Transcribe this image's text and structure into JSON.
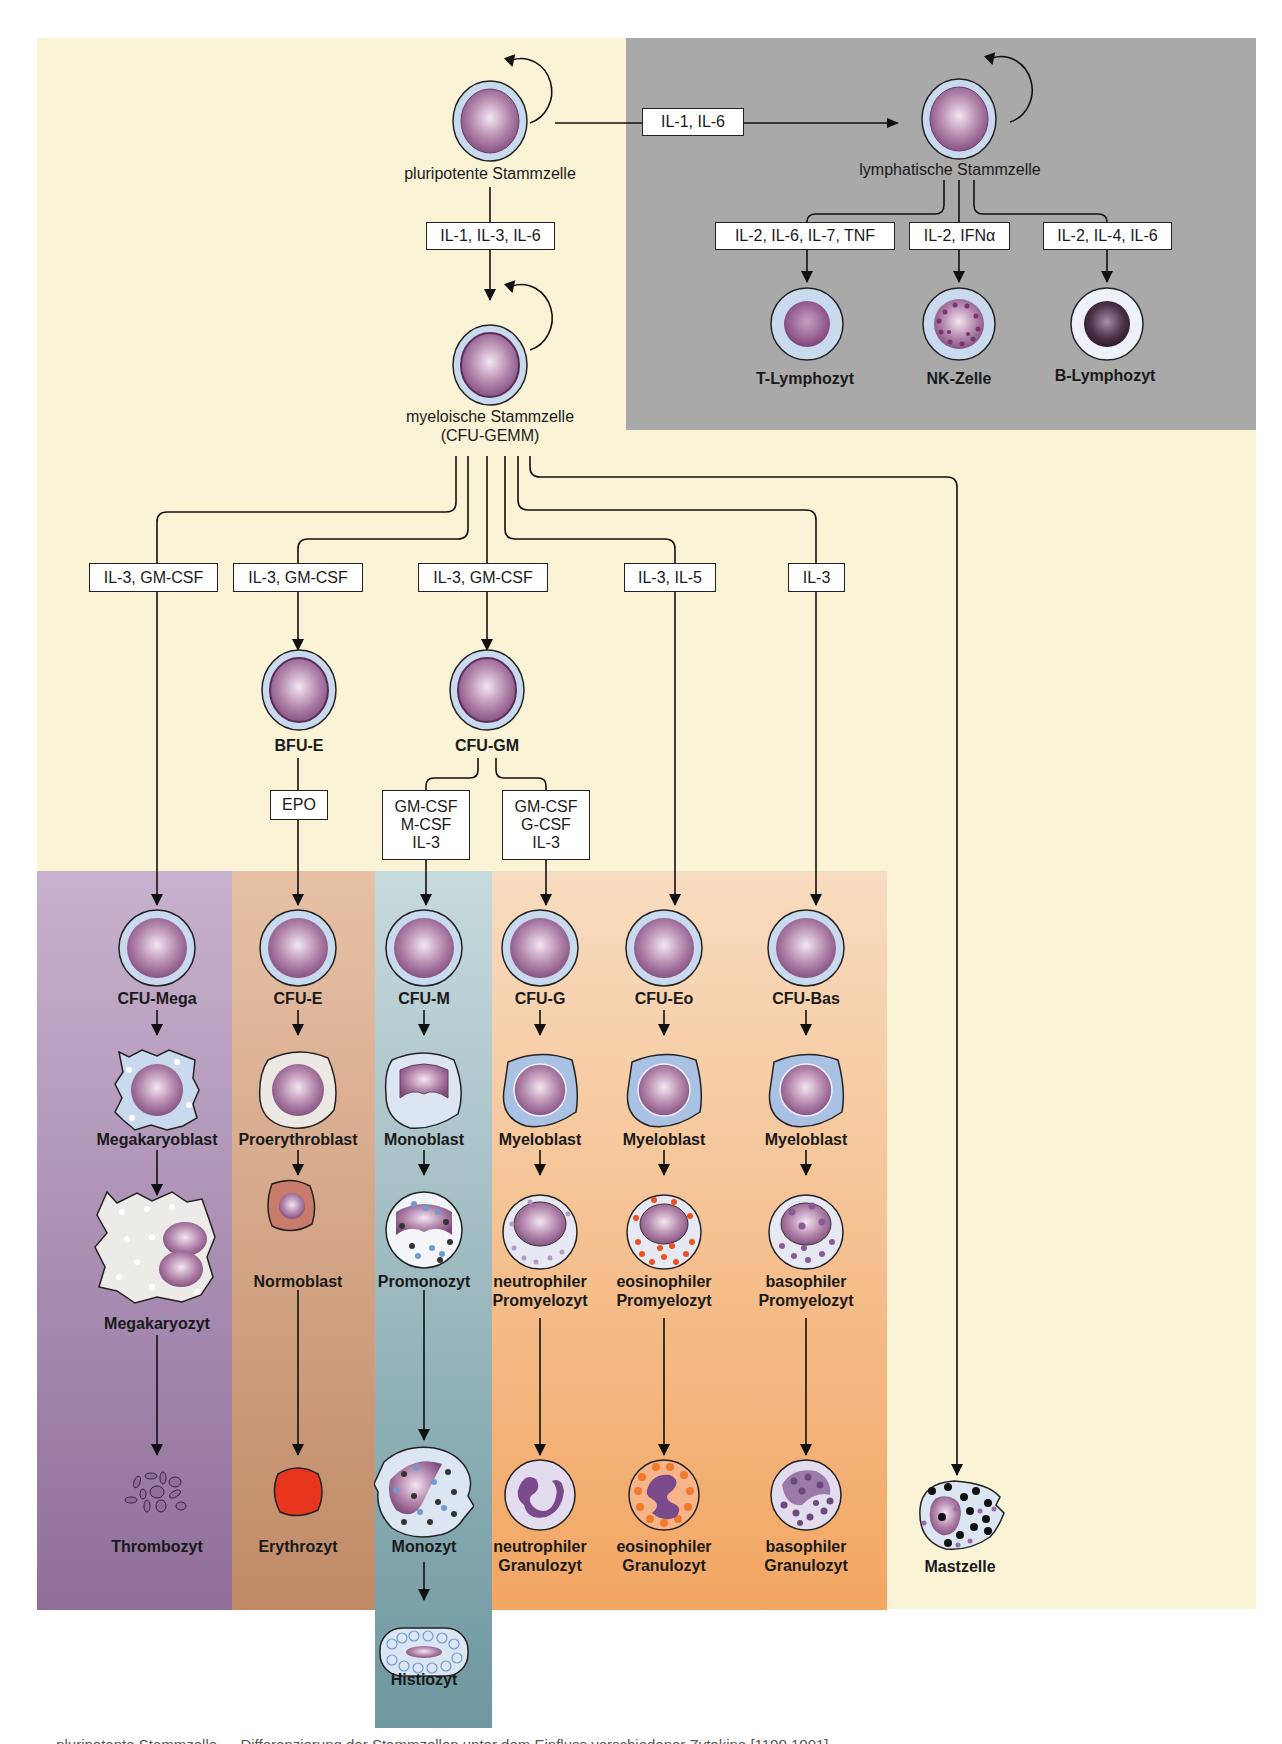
{
  "figure": {
    "caption_partial": "… pluripotente Stammzelle … Differenzierung der Stammzellen unter dem Einfluss verschiedener Zytokine [1100 1001]",
    "colors": {
      "background_cream": "#fbf3d6",
      "lymphatic_panel": "#a9a9a9",
      "megakaryocyte_lineage": "#a98bb2",
      "erythrocyte_lineage": "#d6a584",
      "monocyte_lineage": "#93b3b9",
      "granulocyte_lineage": "#f4bb86",
      "erythrocyte_red": "#e8361e",
      "eosinophil_granule": "#f06a2a"
    }
  },
  "stem_cells": {
    "pluripotent": "pluripotente Stammzelle",
    "lymphatic": "lymphatische Stammzelle",
    "myeloid_line1": "myeloische Stammzelle",
    "myeloid_line2": "(CFU-GEMM)"
  },
  "cytokines": {
    "to_lymphatic": "IL-1, IL-6",
    "to_myeloid": "IL-1, IL-3, IL-6",
    "t_lymph": "IL-2, IL-6, IL-7, TNF",
    "nk": "IL-2, IFNα",
    "b_lymph": "IL-2, IL-4, IL-6",
    "mega": "IL-3, GM-CSF",
    "bfu_e": "IL-3, GM-CSF",
    "cfu_gm": "IL-3, GM-CSF",
    "eo": "IL-3, IL-5",
    "bas": "IL-3",
    "epo": "EPO",
    "mono": [
      "GM-CSF",
      "M-CSF",
      "IL-3"
    ],
    "gran": [
      "GM-CSF",
      "G-CSF",
      "IL-3"
    ]
  },
  "lymphoid_cells": {
    "t": "T-Lymphozyt",
    "nk": "NK-Zelle",
    "b": "B-Lymphozyt"
  },
  "progenitors": {
    "bfu_e": "BFU-E",
    "cfu_gm": "CFU-GM"
  },
  "lineages": [
    {
      "cfu": "CFU-Mega",
      "blast": "Megakaryoblast",
      "inter": [
        "Megakaryozyt"
      ],
      "final": [
        "Thrombozyt"
      ]
    },
    {
      "cfu": "CFU-E",
      "blast": "Proerythroblast",
      "inter": [
        "Normoblast"
      ],
      "final": [
        "Erythrozyt"
      ]
    },
    {
      "cfu": "CFU-M",
      "blast": "Monoblast",
      "inter": [
        "Promonozyt"
      ],
      "final": [
        "Monozyt"
      ],
      "extra": "Histiozyt"
    },
    {
      "cfu": "CFU-G",
      "blast": "Myeloblast",
      "inter": [
        "neutrophiler",
        "Promyelozyt"
      ],
      "final": [
        "neutrophiler",
        "Granulozyt"
      ]
    },
    {
      "cfu": "CFU-Eo",
      "blast": "Myeloblast",
      "inter": [
        "eosinophiler",
        "Promyelozyt"
      ],
      "final": [
        "eosinophiler",
        "Granulozyt"
      ]
    },
    {
      "cfu": "CFU-Bas",
      "blast": "Myeloblast",
      "inter": [
        "basophiler",
        "Promyelozyt"
      ],
      "final": [
        "basophiler",
        "Granulozyt"
      ]
    }
  ],
  "mast_cell": "Mastzelle"
}
